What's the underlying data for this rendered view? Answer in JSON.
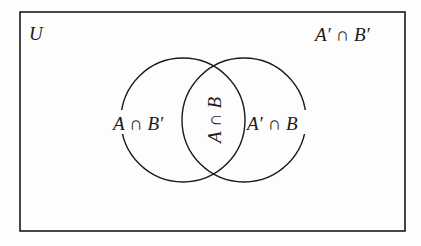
{
  "diagram": {
    "type": "venn",
    "universe_label": "U",
    "regions": {
      "outside": "A′ ∩ B′",
      "a_only": "A ∩ B′",
      "intersection": "A ∩ B",
      "b_only": "A′ ∩ B"
    },
    "colors": {
      "stroke": "#1a1a1a",
      "background": "#fdfdfd"
    }
  }
}
